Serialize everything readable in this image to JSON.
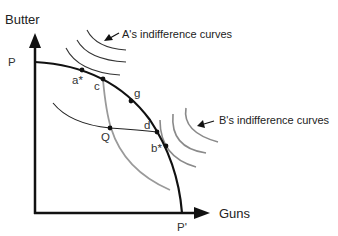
{
  "axes": {
    "y_label": "Butter",
    "x_label": "Guns",
    "y_intercept_label": "P",
    "x_intercept_label": "P'"
  },
  "points": {
    "a_star": "a*",
    "c": "c",
    "g": "g",
    "d": "d",
    "b_star": "b*",
    "q": "Q"
  },
  "annotations": {
    "a_curves": "A's indifference curves",
    "b_curves": "B's indifference curves"
  },
  "colors": {
    "ppf": "#111111",
    "a_curves": "#333333",
    "b_curves": "#8a8a8a",
    "contract_curve": "#9a9a9a",
    "q_curve": "#222222"
  }
}
